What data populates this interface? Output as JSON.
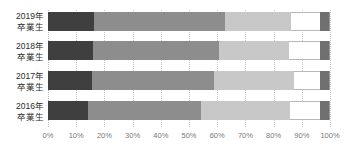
{
  "chart_data": {
    "type": "bar",
    "orientation": "horizontal",
    "stacked": true,
    "normalized_percent": true,
    "title": "",
    "subtitle": "",
    "xlabel": "",
    "ylabel": "",
    "xlim": [
      0,
      100
    ],
    "grid": true,
    "grid_axis": "x",
    "legend": false,
    "legend_position": "none",
    "categories": [
      "2019年\n卒業生",
      "2018年\n卒業生",
      "2017年\n卒業生",
      "2016年\n卒業生"
    ],
    "category_lines": [
      [
        "2019年",
        "卒業生"
      ],
      [
        "2018年",
        "卒業生"
      ],
      [
        "2017年",
        "卒業生"
      ],
      [
        "2016年",
        "卒業生"
      ]
    ],
    "tick_labels": [
      "0%",
      "10%",
      "20%",
      "30%",
      "40%",
      "50%",
      "60%",
      "70%",
      "80%",
      "90%",
      "100%"
    ],
    "tick_values": [
      0,
      10,
      20,
      30,
      40,
      50,
      60,
      70,
      80,
      90,
      100
    ],
    "series": [
      {
        "name": "segment-1",
        "color": "#3f3f3f",
        "values": [
          16.3,
          16.0,
          15.7,
          14.2
        ]
      },
      {
        "name": "segment-2",
        "color": "#8d8d8d",
        "values": [
          46.5,
          44.5,
          43.0,
          39.9
        ]
      },
      {
        "name": "segment-3",
        "color": "#c8c8c8",
        "values": [
          23.4,
          24.8,
          28.4,
          31.8
        ]
      },
      {
        "name": "segment-4",
        "color": "#ffffff",
        "values": [
          10.3,
          11.2,
          9.4,
          10.6
        ]
      },
      {
        "name": "segment-5",
        "color": "#707070",
        "values": [
          3.5,
          3.5,
          3.5,
          3.5
        ]
      }
    ],
    "rows": [
      {
        "category_lines": [
          "2019年",
          "卒業生"
        ],
        "values": [
          16.3,
          46.5,
          23.4,
          10.3,
          3.5
        ]
      },
      {
        "category_lines": [
          "2018年",
          "卒業生"
        ],
        "values": [
          16.0,
          44.5,
          24.8,
          11.2,
          3.5
        ]
      },
      {
        "category_lines": [
          "2017年",
          "卒業生"
        ],
        "values": [
          15.7,
          43.0,
          28.4,
          9.4,
          3.5
        ]
      },
      {
        "category_lines": [
          "2016年",
          "卒業生"
        ],
        "values": [
          14.2,
          39.9,
          31.8,
          10.6,
          3.5
        ]
      }
    ]
  },
  "colors": {
    "segment_1": "#3f3f3f",
    "segment_2": "#8d8d8d",
    "segment_3": "#c8c8c8",
    "segment_4": "#ffffff",
    "segment_5": "#707070",
    "gridline": "#c9c9c9",
    "tick_text": "#7a7a7a",
    "category_text": "#2b2b2b",
    "background": "#ffffff"
  }
}
